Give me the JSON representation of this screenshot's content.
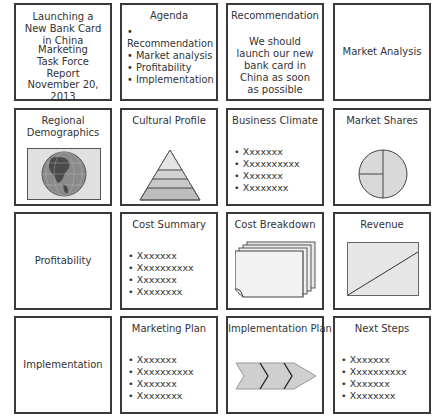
{
  "storyboard": {
    "slides": [
      {
        "id": "cover",
        "lines_a": "Launching a New Bank Card in China",
        "lines_b": "Marketing Task Force Report",
        "date": "November 20, 2013"
      },
      {
        "id": "agenda",
        "title": "Agenda",
        "bullets": [
          "Recommendation",
          "Market analysis",
          "Profitability",
          "Implementation"
        ]
      },
      {
        "id": "recommendation",
        "title": "Recommendation",
        "body": "We should launch our new bank card in China as soon as possible"
      },
      {
        "id": "market-analysis",
        "title": "Market Analysis"
      },
      {
        "id": "regional-demographics",
        "title": "Regional Demographics",
        "icon": "globe-icon"
      },
      {
        "id": "cultural-profile",
        "title": "Cultural Profile",
        "icon": "pyramid-icon"
      },
      {
        "id": "business-climate",
        "title": "Business Climate",
        "bullets": [
          "Xxxxxxx",
          "Xxxxxxxxxx",
          "Xxxxxxx",
          "Xxxxxxxx"
        ]
      },
      {
        "id": "market-shares",
        "title": "Market Shares",
        "icon": "pie-chart-icon"
      },
      {
        "id": "profitability",
        "title": "Profitability"
      },
      {
        "id": "cost-summary",
        "title": "Cost Summary",
        "bullets": [
          "Xxxxxxx",
          "Xxxxxxxxxx",
          "Xxxxxxx",
          "Xxxxxxxx"
        ]
      },
      {
        "id": "cost-breakdown",
        "title": "Cost Breakdown",
        "icon": "stacked-pages-icon"
      },
      {
        "id": "revenue",
        "title": "Revenue",
        "icon": "line-chart-icon"
      },
      {
        "id": "implementation",
        "title": "Implementation"
      },
      {
        "id": "marketing-plan",
        "title": "Marketing Plan",
        "bullets": [
          "Xxxxxxx",
          "Xxxxxxxxxx",
          "Xxxxxxx",
          "Xxxxxxxx"
        ]
      },
      {
        "id": "implementation-plan",
        "title": "Implementation Plan",
        "icon": "chevron-process-icon"
      },
      {
        "id": "next-steps",
        "title": "Next Steps",
        "bullets": [
          "Xxxxxxx",
          "Xxxxxxxxxx",
          "Xxxxxxx",
          "Xxxxxxxx"
        ]
      }
    ]
  },
  "colors": {
    "border": "#3a3a3a",
    "fill": "#d9d9d9",
    "text": "#333333"
  }
}
